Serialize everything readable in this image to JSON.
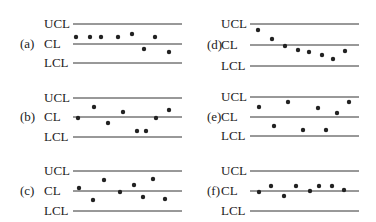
{
  "line_labels": {
    "ucl": "UCL",
    "cl": "CL",
    "lcl": "LCL"
  },
  "panels": [
    {
      "id": "a",
      "label": "(a)",
      "x": 0,
      "ucl_y": 24,
      "cl_y": 44,
      "lcl_y": 63,
      "points": [
        [
          76,
          37
        ],
        [
          90,
          37
        ],
        [
          101,
          37
        ],
        [
          118,
          37
        ],
        [
          132,
          34
        ],
        [
          144,
          49
        ],
        [
          155,
          37
        ],
        [
          169,
          52
        ]
      ]
    },
    {
      "id": "b",
      "label": "(b)",
      "x": 0,
      "ucl_y": 98,
      "cl_y": 117,
      "lcl_y": 137,
      "points": [
        [
          78,
          118
        ],
        [
          94,
          107
        ],
        [
          108,
          123
        ],
        [
          123,
          112
        ],
        [
          137,
          131
        ],
        [
          146,
          131
        ],
        [
          156,
          118
        ],
        [
          169,
          110
        ]
      ]
    },
    {
      "id": "c",
      "label": "(c)",
      "x": 0,
      "ucl_y": 171,
      "cl_y": 191,
      "lcl_y": 211,
      "points": [
        [
          79,
          188
        ],
        [
          93,
          200
        ],
        [
          104,
          180
        ],
        [
          120,
          192
        ],
        [
          134,
          185
        ],
        [
          143,
          197
        ],
        [
          153,
          179
        ],
        [
          165,
          199
        ]
      ]
    },
    {
      "id": "d",
      "label": "(d)",
      "x": 1,
      "ucl_y": 24,
      "cl_y": 45,
      "lcl_y": 66,
      "points": [
        [
          258,
          30
        ],
        [
          272,
          39
        ],
        [
          285,
          46
        ],
        [
          298,
          50
        ],
        [
          309,
          52
        ],
        [
          322,
          55
        ],
        [
          333,
          59
        ],
        [
          345,
          51
        ]
      ]
    },
    {
      "id": "e",
      "label": "(e)",
      "x": 1,
      "ucl_y": 97,
      "cl_y": 117,
      "lcl_y": 136,
      "points": [
        [
          259,
          107
        ],
        [
          274,
          126
        ],
        [
          288,
          102
        ],
        [
          303,
          130
        ],
        [
          318,
          108
        ],
        [
          326,
          130
        ],
        [
          337,
          113
        ],
        [
          349,
          102
        ]
      ]
    },
    {
      "id": "f",
      "label": "(f)",
      "x": 1,
      "ucl_y": 171,
      "cl_y": 191,
      "lcl_y": 211,
      "points": [
        [
          259,
          192
        ],
        [
          271,
          186
        ],
        [
          284,
          196
        ],
        [
          296,
          186
        ],
        [
          310,
          191
        ],
        [
          319,
          186
        ],
        [
          332,
          186
        ],
        [
          344,
          190
        ]
      ]
    }
  ],
  "layout": {
    "columns": [
      {
        "paren_x": 20,
        "text_x": 44,
        "line_x1": 73,
        "line_x2": 182
      },
      {
        "paren_x": 207,
        "text_x": 221,
        "line_x1": 250,
        "line_x2": 359
      }
    ],
    "colors": {
      "line": "#333333",
      "dot": "#222222",
      "text": "#222222"
    }
  }
}
